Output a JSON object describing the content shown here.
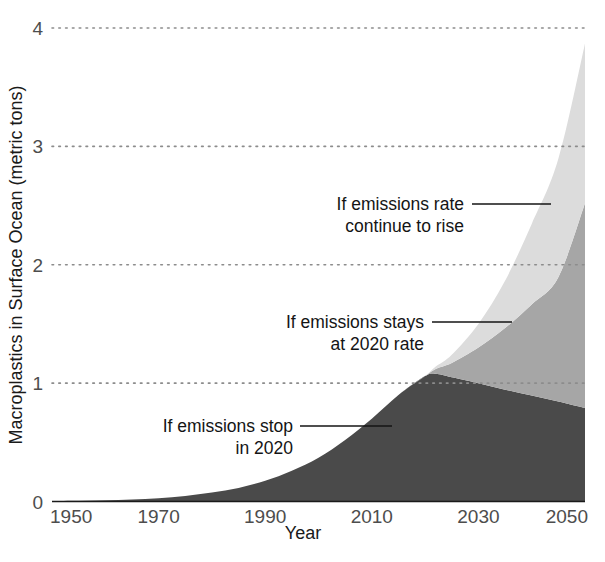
{
  "chart_data": {
    "type": "area",
    "title": "",
    "subtitle": "",
    "xlabel": "Year",
    "ylabel": "Macroplastics in Surface Ocean (metric tons)",
    "xlim": [
      1950,
      2050
    ],
    "ylim": [
      0,
      4
    ],
    "xticks": [
      1950,
      1970,
      1990,
      2010,
      2030,
      2050
    ],
    "xticklabels": [
      "1950",
      "1970",
      "1990",
      "2010",
      "2030",
      "2050"
    ],
    "yticks": [
      0,
      1,
      2,
      3,
      4
    ],
    "yticklabels": [
      "0",
      "1",
      "2",
      "3",
      "4"
    ],
    "grid": "horizontal-dotted",
    "legend_position": "none",
    "stacked": true,
    "x": [
      1950,
      1955,
      1960,
      1965,
      1970,
      1975,
      1980,
      1985,
      1990,
      1995,
      2000,
      2005,
      2010,
      2015,
      2020,
      2022,
      2025,
      2030,
      2035,
      2040,
      2045,
      2050
    ],
    "series": [
      {
        "name": "If emissions stop in 2020",
        "color": "#4a4a4a",
        "values": [
          0.004,
          0.006,
          0.01,
          0.017,
          0.028,
          0.047,
          0.075,
          0.115,
          0.175,
          0.26,
          0.37,
          0.52,
          0.7,
          0.9,
          1.06,
          1.08,
          1.05,
          1.0,
          0.945,
          0.895,
          0.845,
          0.79
        ]
      },
      {
        "name": "If emissions stays at 2020 rate",
        "color": "#a6a6a6",
        "values": [
          0.0,
          0.0,
          0.0,
          0.0,
          0.0,
          0.0,
          0.0,
          0.0,
          0.0,
          0.0,
          0.0,
          0.0,
          0.0,
          0.0,
          0.0,
          0.04,
          0.12,
          0.3,
          0.52,
          0.77,
          1.05,
          1.73
        ]
      },
      {
        "name": "If emissions rate continue to rise",
        "color": "#dcdcdc",
        "values": [
          0.0,
          0.0,
          0.0,
          0.0,
          0.0,
          0.0,
          0.0,
          0.0,
          0.0,
          0.0,
          0.0,
          0.0,
          0.0,
          0.0,
          0.0,
          0.02,
          0.07,
          0.2,
          0.4,
          0.68,
          1.0,
          1.35
        ]
      }
    ],
    "cumulative_totals": {
      "stop_2020_at_2050": 0.79,
      "stays_2020_rate_at_2050": 2.52,
      "rate_continues_rising_at_2050": 3.87
    },
    "annotations": [
      {
        "id": "annotation-rising",
        "lines": [
          "If emissions rate",
          "continue to rise"
        ],
        "target_series": "If emissions rate continue to rise"
      },
      {
        "id": "annotation-stays",
        "lines": [
          "If emissions stays",
          "at 2020 rate"
        ],
        "target_series": "If emissions stays at 2020 rate"
      },
      {
        "id": "annotation-stop",
        "lines": [
          "If emissions stop",
          "in 2020"
        ],
        "target_series": "If emissions stop in 2020"
      }
    ]
  },
  "colors": {
    "band_dark": "#4a4a4a",
    "band_mid": "#a6a6a6",
    "band_light": "#dcdcdc",
    "axis": "#1a1a1a",
    "gridline": "#8c8c8c",
    "tick_label": "#4d4d4d",
    "annotation_text": "#141414",
    "background": "#ffffff"
  }
}
